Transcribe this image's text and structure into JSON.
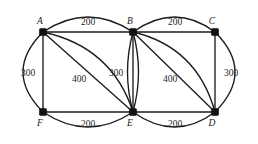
{
  "figure": {
    "background_color": "#ffffff",
    "stroke_color": "#1c1c1c",
    "vertex_color": "#121212"
  },
  "vertices": [
    {
      "id": "A",
      "label": "A",
      "x": 43,
      "y": 32,
      "label_x": 40,
      "label_y": 24
    },
    {
      "id": "B",
      "label": "B",
      "x": 133,
      "y": 32,
      "label_x": 130,
      "label_y": 24
    },
    {
      "id": "C",
      "label": "C",
      "x": 215,
      "y": 32,
      "label_x": 212,
      "label_y": 24
    },
    {
      "id": "F",
      "label": "F",
      "x": 43,
      "y": 112,
      "label_x": 40,
      "label_y": 126
    },
    {
      "id": "E",
      "label": "E",
      "x": 133,
      "y": 112,
      "label_x": 130,
      "label_y": 126
    },
    {
      "id": "D",
      "label": "D",
      "x": 215,
      "y": 112,
      "label_x": 212,
      "label_y": 126
    }
  ],
  "edges": [
    {
      "id": "AB-straight",
      "from": "A",
      "to": "B",
      "shape": "line",
      "weight": "200"
    },
    {
      "id": "AB-arc",
      "from": "A",
      "to": "B",
      "shape": "curve",
      "weight": null
    },
    {
      "id": "BC-straight",
      "from": "B",
      "to": "C",
      "shape": "line",
      "weight": "200"
    },
    {
      "id": "BC-arc",
      "from": "B",
      "to": "C",
      "shape": "curve",
      "weight": null
    },
    {
      "id": "FE-straight",
      "from": "F",
      "to": "E",
      "shape": "line",
      "weight": "200"
    },
    {
      "id": "FE-arc",
      "from": "F",
      "to": "E",
      "shape": "curve",
      "weight": null
    },
    {
      "id": "ED-straight",
      "from": "E",
      "to": "D",
      "shape": "line",
      "weight": "200"
    },
    {
      "id": "ED-arc",
      "from": "E",
      "to": "D",
      "shape": "curve",
      "weight": null
    },
    {
      "id": "AF-straight",
      "from": "A",
      "to": "F",
      "shape": "line",
      "weight": null
    },
    {
      "id": "AF-arc",
      "from": "A",
      "to": "F",
      "shape": "curve",
      "weight": "300"
    },
    {
      "id": "CD-straight",
      "from": "C",
      "to": "D",
      "shape": "line",
      "weight": null
    },
    {
      "id": "CD-arc",
      "from": "C",
      "to": "D",
      "shape": "curve",
      "weight": "300"
    },
    {
      "id": "BE-straight",
      "from": "B",
      "to": "E",
      "shape": "line",
      "weight": null
    },
    {
      "id": "BE-arc-left",
      "from": "B",
      "to": "E",
      "shape": "curve",
      "weight": "300"
    },
    {
      "id": "BE-arc-right",
      "from": "B",
      "to": "E",
      "shape": "curve",
      "weight": null
    },
    {
      "id": "AE-diagonal",
      "from": "A",
      "to": "E",
      "shape": "line",
      "weight": "400"
    },
    {
      "id": "AE-curve",
      "from": "A",
      "to": "E",
      "shape": "curve",
      "weight": null
    },
    {
      "id": "BD-diagonal",
      "from": "B",
      "to": "D",
      "shape": "line",
      "weight": "400"
    },
    {
      "id": "BD-curve",
      "from": "B",
      "to": "D",
      "shape": "curve",
      "weight": null
    }
  ],
  "weight_labels": [
    {
      "id": "w-ab",
      "text": "200",
      "x": 88,
      "y": 25,
      "anchor": "middle"
    },
    {
      "id": "w-bc",
      "text": "200",
      "x": 175,
      "y": 25,
      "anchor": "middle"
    },
    {
      "id": "w-af",
      "text": "300",
      "x": 28,
      "y": 76,
      "anchor": "middle"
    },
    {
      "id": "w-cd",
      "text": "300",
      "x": 231,
      "y": 76,
      "anchor": "middle"
    },
    {
      "id": "w-ae",
      "text": "400",
      "x": 79,
      "y": 82,
      "anchor": "middle"
    },
    {
      "id": "w-be",
      "text": "300",
      "x": 116,
      "y": 76,
      "anchor": "middle"
    },
    {
      "id": "w-bd",
      "text": "400",
      "x": 170,
      "y": 82,
      "anchor": "middle"
    },
    {
      "id": "w-fe",
      "text": "200",
      "x": 88,
      "y": 127,
      "anchor": "middle"
    },
    {
      "id": "w-ed",
      "text": "200",
      "x": 175,
      "y": 127,
      "anchor": "middle"
    }
  ]
}
